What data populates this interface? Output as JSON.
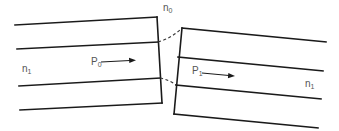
{
  "diagram": {
    "labels": {
      "gap_medium": {
        "base": "n",
        "sub": "0"
      },
      "left_index": {
        "base": "n",
        "sub": "1"
      },
      "right_index": {
        "base": "n",
        "sub": "1"
      },
      "left_power": {
        "base": "P",
        "sub": "0"
      },
      "right_power": {
        "base": "P",
        "sub": "1"
      }
    },
    "colors": {
      "line": "#1a1a1a",
      "label": "#555555",
      "background": "#ffffff"
    }
  }
}
